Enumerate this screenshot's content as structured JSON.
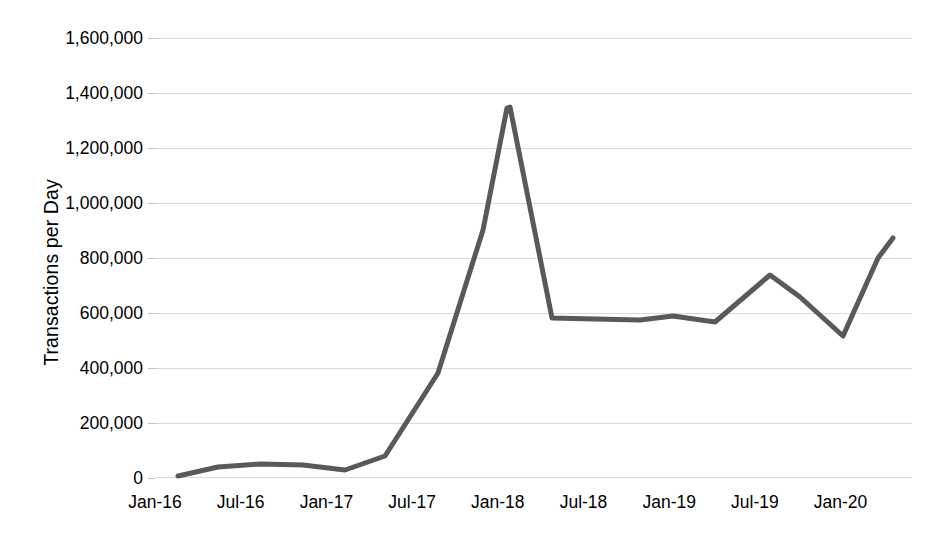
{
  "chart_data": {
    "type": "line",
    "title": "",
    "subtitle": "",
    "xlabel": "",
    "ylabel": "Transactions per Day",
    "ylim": [
      0,
      1600000
    ],
    "grid": true,
    "legend": false,
    "legend_position": "none",
    "line_color": "#595959",
    "line_width_px": 5,
    "y_tick_labels": [
      "1,600,000",
      "1,400,000",
      "1,200,000",
      "1,000,000",
      "800,000",
      "600,000",
      "400,000",
      "200,000",
      "0"
    ],
    "y_tick_values": [
      1600000,
      1400000,
      1200000,
      1000000,
      800000,
      600000,
      400000,
      200000,
      0
    ],
    "x_tick_labels": [
      "Jan-16",
      "Jul-16",
      "Jan-17",
      "Jul-17",
      "Jan-18",
      "Jul-18",
      "Jan-19",
      "Jul-19",
      "Jan-20"
    ],
    "x_tick_months": [
      0,
      6,
      12,
      18,
      24,
      30,
      36,
      42,
      48
    ],
    "x_range_months": [
      0,
      53
    ],
    "x": [
      "Jan-16",
      "Apr-16",
      "Jul-16",
      "Oct-16",
      "Jan-17",
      "Apr-17",
      "Jul-17",
      "Oct-17",
      "Nov-17",
      "Jan-18",
      "Apr-18",
      "Jul-18",
      "Oct-18",
      "Jan-19",
      "Apr-19",
      "Jul-19",
      "Oct-19",
      "Jan-20",
      "Apr-20",
      "Jun-20"
    ],
    "values": [
      12000,
      32000,
      45000,
      43000,
      38000,
      90000,
      385000,
      900000,
      1345000,
      1345000,
      595000,
      592000,
      590000,
      555000,
      600000,
      740000,
      640000,
      515000,
      815000,
      885000
    ],
    "series": [
      {
        "name": "Transactions per Day",
        "values": [
          12000,
          32000,
          45000,
          43000,
          38000,
          90000,
          385000,
          900000,
          1345000,
          1345000,
          595000,
          592000,
          590000,
          555000,
          600000,
          740000,
          640000,
          515000,
          815000,
          885000
        ]
      }
    ],
    "annotations": [],
    "points_px": [
      [
        178,
        476
      ],
      [
        218,
        467
      ],
      [
        260,
        464
      ],
      [
        303,
        465
      ],
      [
        345,
        470
      ],
      [
        385,
        456
      ],
      [
        438,
        373
      ],
      [
        483,
        230
      ],
      [
        507,
        108
      ],
      [
        510,
        107
      ],
      [
        552,
        318
      ],
      [
        595,
        319
      ],
      [
        640,
        320
      ],
      [
        673,
        316
      ],
      [
        715,
        322
      ],
      [
        770,
        275
      ],
      [
        800,
        297
      ],
      [
        843,
        336
      ],
      [
        878,
        258
      ],
      [
        893,
        238
      ]
    ]
  }
}
